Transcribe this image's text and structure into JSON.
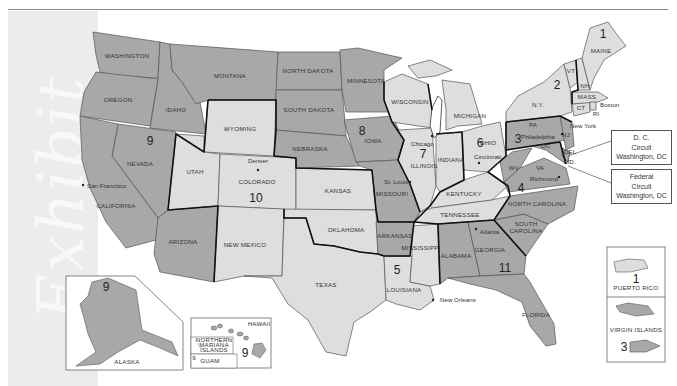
{
  "page": {
    "watermark": "Exhibit"
  },
  "map": {
    "title": "Geographic Boundaries of United States Courts of Appeals and District Courts",
    "colors": {
      "dark": "#a8a8a8",
      "medium": "#bdbdbd",
      "light": "#dedede",
      "water": "#ffffff",
      "circuit_border": "#111111",
      "state_border": "#555555"
    },
    "circuits": [
      {
        "number": "1",
        "states": [
          "MAINE",
          "NH",
          "MASS",
          "RI",
          "PUERTO RICO"
        ]
      },
      {
        "number": "2",
        "states": [
          "N.Y.",
          "VT",
          "CT"
        ]
      },
      {
        "number": "3",
        "states": [
          "PA",
          "NJ",
          "DEL",
          "VIRGIN ISLANDS"
        ]
      },
      {
        "number": "4",
        "states": [
          "MD",
          "WV",
          "VA",
          "NORTH CAROLINA",
          "SOUTH CAROLINA"
        ]
      },
      {
        "number": "5",
        "states": [
          "TEXAS",
          "LOUISIANA",
          "MISSISSIPPI"
        ]
      },
      {
        "number": "6",
        "states": [
          "OHIO",
          "MICHIGAN",
          "KENTUCKY",
          "TENNESSEE"
        ]
      },
      {
        "number": "7",
        "states": [
          "ILLINOIS",
          "INDIANA",
          "WISCONSIN"
        ]
      },
      {
        "number": "8",
        "states": [
          "NORTH DAKOTA",
          "SOUTH DAKOTA",
          "NEBRASKA",
          "MINNESOTA",
          "IOWA",
          "MISSOURI",
          "ARKANSAS"
        ]
      },
      {
        "number": "9",
        "states": [
          "WASHINGTON",
          "OREGON",
          "IDAHO",
          "MONTANA",
          "NEVADA",
          "CALIFORNIA",
          "ARIZONA",
          "ALASKA",
          "HAWAII",
          "NORTHERN MARIANA ISLANDS",
          "GUAM"
        ]
      },
      {
        "number": "10",
        "states": [
          "WYOMING",
          "UTAH",
          "COLORADO",
          "KANSAS",
          "NEW MEXICO",
          "OKLAHOMA"
        ]
      },
      {
        "number": "11",
        "states": [
          "ALABAMA",
          "GEORGIA",
          "FLORIDA"
        ]
      }
    ],
    "state_labels": {
      "washington": "WASHINGTON",
      "oregon": "OREGON",
      "idaho": "IDAHO",
      "montana": "MONTANA",
      "nevada": "NEVADA",
      "california": "CALIFORNIA",
      "arizona": "ARIZONA",
      "wyoming": "WYOMING",
      "utah": "UTAH",
      "colorado": "COLORADO",
      "new_mexico": "NEW MEXICO",
      "kansas": "KANSAS",
      "oklahoma": "OKLAHOMA",
      "texas": "TEXAS",
      "north_dakota": "NORTH DAKOTA",
      "south_dakota": "SOUTH DAKOTA",
      "nebraska": "NEBRASKA",
      "minnesota": "MINNESOTA",
      "iowa": "IOWA",
      "missouri": "MISSOURI",
      "arkansas": "ARKANSAS",
      "louisiana": "LOUISIANA",
      "mississippi": "MISSISSIPPI",
      "wisconsin": "WISCONSIN",
      "illinois": "ILLINOIS",
      "indiana": "INDIANA",
      "michigan": "MICHIGAN",
      "ohio": "OHIO",
      "kentucky": "KENTUCKY",
      "tennessee": "TENNESSEE",
      "alabama": "ALABAMA",
      "georgia": "GEORGIA",
      "florida": "FLORIDA",
      "south_carolina_1": "SOUTH",
      "south_carolina_2": "CAROLINA",
      "north_carolina": "NORTH CAROLINA",
      "virginia": "VA",
      "west_virginia": "WV",
      "maryland": "MD.",
      "delaware": "DEL",
      "dc": "DC",
      "pennsylvania": "PA",
      "new_jersey": "NJ",
      "new_york": "N.Y.",
      "vermont": "VT",
      "new_hampshire": "NH",
      "maine": "MAINE",
      "massachusetts": "MASS",
      "connecticut": "CT",
      "rhode_island": "RI",
      "alaska": "ALASKA",
      "hawaii": "HAWAII",
      "northern_mariana_1": "NORTHERN",
      "northern_mariana_2": "MARIANA",
      "northern_mariana_3": "ISLANDS",
      "guam": "GUAM",
      "puerto_rico": "PUERTO RICO",
      "virgin_islands": "VIRGIN ISLANDS"
    },
    "cities": {
      "san_francisco": "San Francisco",
      "denver": "Denver",
      "st_louis": "St. Louis",
      "chicago": "Chicago",
      "cincinnati": "Cincinnati",
      "new_orleans": "New Orleans",
      "atlanta": "Atlanta",
      "richmond": "Richmond",
      "philadelphia": "Philadelphia",
      "new_york": "New York",
      "boston": "Boston"
    },
    "circuit_numbers": {
      "c1": "1",
      "c2": "2",
      "c3": "3",
      "c4": "4",
      "c5": "5",
      "c6": "6",
      "c7": "7",
      "c8": "8",
      "c9": "9",
      "c10": "10",
      "c11": "11",
      "alaska": "9",
      "hawaii": "9",
      "guam": "9",
      "puerto_rico": "1",
      "virgin_islands": "3"
    },
    "callouts": {
      "dc_circuit": {
        "line1": "D. C.",
        "line2": "Circuit",
        "line3": "Washington, DC"
      },
      "federal_circuit": {
        "line1": "Federal",
        "line2": "Circuit",
        "line3": "Washington, DC"
      }
    }
  }
}
